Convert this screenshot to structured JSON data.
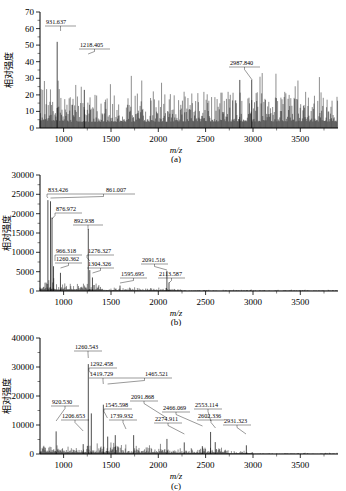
{
  "figure": {
    "axis_y_label": "相对强度",
    "axis_x_label": "m/z",
    "captions": {
      "a": "(a)",
      "b": "(b)",
      "c": "(c)"
    }
  },
  "chart_data": [
    {
      "type": "line",
      "panel": "(a)",
      "title": "",
      "xlabel": "m/z",
      "ylabel": "相对强度",
      "xlim": [
        750,
        3900
      ],
      "ylim": [
        0,
        70
      ],
      "xticks": [
        1000,
        1500,
        2000,
        2500,
        3000,
        3500
      ],
      "yticks": [
        0,
        10,
        20,
        30,
        40,
        50,
        60,
        70
      ],
      "grid": false,
      "legend": "none",
      "annotations": [
        {
          "label": "931.637",
          "mz": 931.637,
          "intensity": 52
        },
        {
          "label": "1218.405",
          "mz": 1218.405,
          "intensity": 34
        },
        {
          "label": "2987.840",
          "mz": 2987.84,
          "intensity": 29
        }
      ],
      "peaks": [
        {
          "mz": 931.637,
          "intensity": 52
        },
        {
          "mz": 1218.405,
          "intensity": 23
        },
        {
          "mz": 2862.0,
          "intensity": 29
        },
        {
          "mz": 2987.84,
          "intensity": 29
        }
      ],
      "baseline_noise": {
        "mean": 8,
        "max": 24,
        "description": "dense noise across full m/z range"
      }
    },
    {
      "type": "line",
      "panel": "(b)",
      "title": "",
      "xlabel": "m/z",
      "ylabel": "相对强度",
      "xlim": [
        750,
        3900
      ],
      "ylim": [
        0,
        30000
      ],
      "xticks": [
        1000,
        1500,
        2000,
        2500,
        3000,
        3500
      ],
      "yticks": [
        0,
        5000,
        10000,
        15000,
        20000,
        25000,
        30000
      ],
      "grid": false,
      "legend": "none",
      "annotations": [
        {
          "label": "833.426",
          "mz": 833.426,
          "intensity": 23500
        },
        {
          "label": "861.007",
          "mz": 861.007,
          "intensity": 23200
        },
        {
          "label": "876.972",
          "mz": 876.972,
          "intensity": 19000
        },
        {
          "label": "892.938",
          "mz": 892.938,
          "intensity": 6400
        },
        {
          "label": "966.318",
          "mz": 966.318,
          "intensity": 4700
        },
        {
          "label": "1260.362",
          "mz": 1260.362,
          "intensity": 16000
        },
        {
          "label": "1276.327",
          "mz": 1276.327,
          "intensity": 5400
        },
        {
          "label": "1304.326",
          "mz": 1304.326,
          "intensity": 3500
        },
        {
          "label": "1595.695",
          "mz": 1595.695,
          "intensity": 1400
        },
        {
          "label": "2091.516",
          "mz": 2091.516,
          "intensity": 5200
        },
        {
          "label": "2113.587",
          "mz": 2113.587,
          "intensity": 2200
        }
      ],
      "peaks": [
        {
          "mz": 833.426,
          "intensity": 23500
        },
        {
          "mz": 861.007,
          "intensity": 23200
        },
        {
          "mz": 876.972,
          "intensity": 19000
        },
        {
          "mz": 892.938,
          "intensity": 6400
        },
        {
          "mz": 966.318,
          "intensity": 4700
        },
        {
          "mz": 1260.362,
          "intensity": 16000
        },
        {
          "mz": 1276.327,
          "intensity": 5400
        },
        {
          "mz": 1304.326,
          "intensity": 3500
        },
        {
          "mz": 1595.695,
          "intensity": 1400
        },
        {
          "mz": 2091.516,
          "intensity": 5200
        },
        {
          "mz": 2113.587,
          "intensity": 2200
        }
      ]
    },
    {
      "type": "line",
      "panel": "(c)",
      "title": "",
      "xlabel": "m/z",
      "ylabel": "相对强度",
      "xlim": [
        750,
        3900
      ],
      "ylim": [
        0,
        40000
      ],
      "xticks": [
        1000,
        1500,
        2000,
        2500,
        3000,
        3500
      ],
      "yticks": [
        0,
        10000,
        20000,
        30000,
        40000
      ],
      "grid": false,
      "legend": "none",
      "annotations": [
        {
          "label": "920.530",
          "mz": 920.53,
          "intensity": 11500
        },
        {
          "label": "1206.653",
          "mz": 1206.653,
          "intensity": 8500
        },
        {
          "label": "1260.543",
          "mz": 1260.543,
          "intensity": 31000
        },
        {
          "label": "1292.458",
          "mz": 1292.458,
          "intensity": 25500
        },
        {
          "label": "1419.729",
          "mz": 1419.729,
          "intensity": 23000
        },
        {
          "label": "1465.521",
          "mz": 1465.521,
          "intensity": 22500
        },
        {
          "label": "1545.598",
          "mz": 1545.598,
          "intensity": 10000
        },
        {
          "label": "1739.932",
          "mz": 1739.932,
          "intensity": 7300
        },
        {
          "label": "2091.868",
          "mz": 2091.868,
          "intensity": 12000
        },
        {
          "label": "2274.911",
          "mz": 2274.911,
          "intensity": 6200
        },
        {
          "label": "2466.069",
          "mz": 2466.069,
          "intensity": 9200
        },
        {
          "label": "2553.114",
          "mz": 2553.114,
          "intensity": 10000
        },
        {
          "label": "2602.336",
          "mz": 2602.336,
          "intensity": 7200
        },
        {
          "label": "2931.323",
          "mz": 2931.323,
          "intensity": 5000
        }
      ],
      "peaks": [
        {
          "mz": 920.53,
          "intensity": 7800
        },
        {
          "mz": 1206.653,
          "intensity": 3400
        },
        {
          "mz": 1260.543,
          "intensity": 31000
        },
        {
          "mz": 1292.458,
          "intensity": 14000
        },
        {
          "mz": 1419.729,
          "intensity": 17000
        },
        {
          "mz": 1465.521,
          "intensity": 6000
        },
        {
          "mz": 1545.598,
          "intensity": 6500
        },
        {
          "mz": 1739.932,
          "intensity": 6500
        },
        {
          "mz": 2091.868,
          "intensity": 5200
        },
        {
          "mz": 2274.911,
          "intensity": 4000
        },
        {
          "mz": 2466.069,
          "intensity": 2700
        },
        {
          "mz": 2553.114,
          "intensity": 7600
        },
        {
          "mz": 2602.336,
          "intensity": 4100
        },
        {
          "mz": 2931.323,
          "intensity": 3000
        }
      ]
    }
  ]
}
